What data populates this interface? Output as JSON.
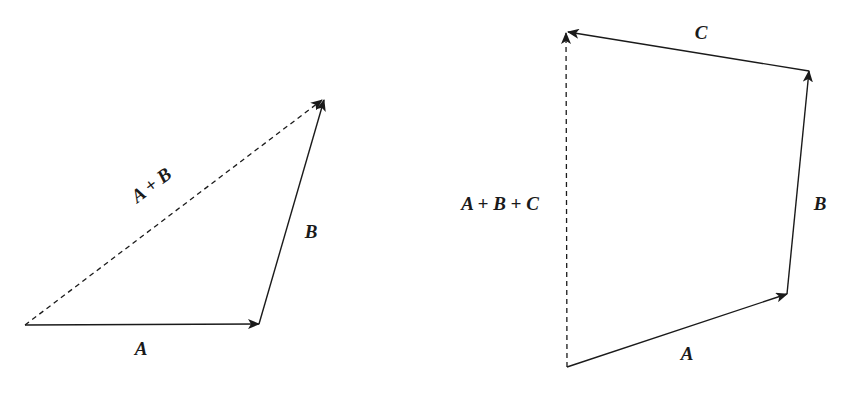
{
  "figure": {
    "type": "vector-addition-diagram",
    "colors": {
      "background": "#ffffff",
      "stroke": "#1a1a1a"
    }
  },
  "left_diagram": {
    "title": "Two-vector addition (triangle rule)",
    "vectors": [
      {
        "id": "A",
        "label": "A",
        "style": "solid",
        "from": [
          25,
          325
        ],
        "to": [
          259,
          324
        ]
      },
      {
        "id": "B",
        "label": "B",
        "style": "solid",
        "from": [
          259,
          324
        ],
        "to": [
          324,
          100
        ]
      },
      {
        "id": "A+B",
        "label": "A + B",
        "style": "dashed",
        "from": [
          25,
          325
        ],
        "to": [
          324,
          99
        ]
      }
    ],
    "labels": {
      "a": "A",
      "b": "B",
      "sum": "A + B"
    }
  },
  "right_diagram": {
    "title": "Three-vector addition (polygon rule)",
    "vectors": [
      {
        "id": "A",
        "label": "A",
        "style": "solid",
        "from": [
          567,
          367
        ],
        "to": [
          787,
          294
        ]
      },
      {
        "id": "B",
        "label": "B",
        "style": "solid",
        "from": [
          787,
          294
        ],
        "to": [
          809,
          71
        ]
      },
      {
        "id": "C",
        "label": "C",
        "style": "solid",
        "from": [
          809,
          71
        ],
        "to": [
          568,
          32
        ]
      },
      {
        "id": "A+B+C",
        "label": "A + B + C",
        "style": "dashed",
        "from": [
          567,
          367
        ],
        "to": [
          566,
          33
        ]
      }
    ],
    "labels": {
      "a": "A",
      "b": "B",
      "c": "C",
      "sum": "A + B + C"
    }
  }
}
